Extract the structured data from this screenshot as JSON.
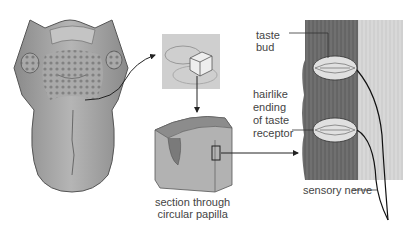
{
  "diagram": {
    "labels": {
      "taste_bud_1": "taste",
      "taste_bud_2": "bud",
      "hairlike_1": "hairlike",
      "hairlike_2": "ending",
      "hairlike_3": "of taste",
      "hairlike_4": "receptor",
      "section_1": "section through",
      "section_2": "circular papilla",
      "sensory_nerve": "sensory nerve"
    },
    "panels": [
      "tongue",
      "papilla-closeup",
      "papilla-section-block",
      "taste-bud-cross-section"
    ],
    "colors": {
      "tissue_dark": "#6e6e6e",
      "tissue_light": "#cfcfcf",
      "outline": "#333333",
      "text": "#444444"
    }
  }
}
